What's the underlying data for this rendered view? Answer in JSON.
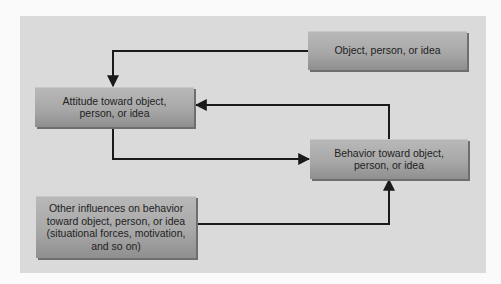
{
  "diagram": {
    "nodes": [
      {
        "id": "object",
        "label": "Object, person, or idea"
      },
      {
        "id": "attitude",
        "label": "Attitude toward object, person, or idea"
      },
      {
        "id": "behavior",
        "label": "Behavior toward object, person, or idea"
      },
      {
        "id": "other",
        "label": "Other influences on behavior toward object, person, or idea (situational forces, motivation, and so on)"
      }
    ],
    "edges": [
      {
        "from": "object",
        "to": "attitude"
      },
      {
        "from": "attitude",
        "to": "behavior"
      },
      {
        "from": "behavior",
        "to": "attitude"
      },
      {
        "from": "other",
        "to": "behavior"
      }
    ],
    "colors": {
      "background": "#dadada",
      "box": "#a8a8a8",
      "line": "#1a1a1a"
    }
  }
}
